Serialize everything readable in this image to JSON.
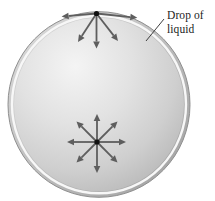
{
  "figure": {
    "width": 215,
    "height": 201,
    "background": "#ffffff",
    "label": {
      "text": "Drop of liquid",
      "line1": "Drop of",
      "line2": "liquid",
      "leader_color": "#3f3f3f"
    },
    "drop": {
      "outline_color": "#8f8f8f",
      "rim_highlight_color": "#f7f7f7",
      "edge_light": "#dedede",
      "edge_dark": "#9e9e9e",
      "body_light": "#f4f4f4",
      "body_mid": "#e2e2e2",
      "body_low": "#cfcfcf",
      "body_dark": "#b0b0b0"
    },
    "arrow_color": "#5e5e5e",
    "dot_color": "#111111",
    "molecules": [
      {
        "name": "surface-molecule",
        "x": 96.5,
        "y": 13.5,
        "arrows": [
          {
            "dir": "left",
            "angle": 175,
            "len": 35
          },
          {
            "dir": "right",
            "angle": 6,
            "len": 41
          },
          {
            "dir": "down-left",
            "angle": 123,
            "len": 34
          },
          {
            "dir": "down",
            "angle": 90,
            "len": 35
          },
          {
            "dir": "down-right",
            "angle": 52,
            "len": 35
          }
        ]
      },
      {
        "name": "interior-molecule",
        "x": 97,
        "y": 142,
        "arrows": [
          {
            "dir": "up",
            "angle": 270,
            "len": 28
          },
          {
            "dir": "up-right",
            "angle": 315,
            "len": 29
          },
          {
            "dir": "right",
            "angle": 0,
            "len": 29
          },
          {
            "dir": "down-right",
            "angle": 45,
            "len": 29
          },
          {
            "dir": "down",
            "angle": 90,
            "len": 31
          },
          {
            "dir": "down-left",
            "angle": 135,
            "len": 29
          },
          {
            "dir": "left",
            "angle": 180,
            "len": 30
          },
          {
            "dir": "up-left",
            "angle": 225,
            "len": 29
          }
        ]
      }
    ]
  }
}
